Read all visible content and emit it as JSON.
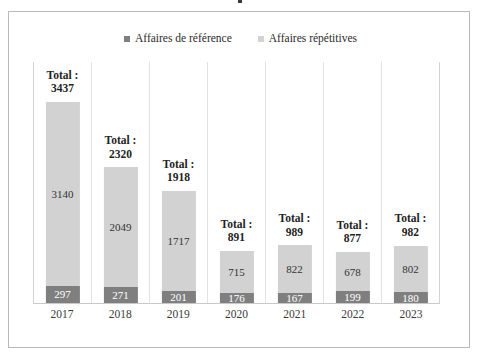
{
  "figure": {
    "background_color": "#ffffff",
    "frame_color": "#b9b9b9"
  },
  "legend": {
    "position": "top-center",
    "entries": [
      {
        "label": "Affaires de référence",
        "color": "#7f7f7f",
        "marker": "square-marker-icon"
      },
      {
        "label": "Affaires répétitives",
        "color": "#d2d2d2",
        "marker": "square-marker-icon"
      }
    ]
  },
  "labels": {
    "total_prefix": "Total :"
  },
  "chart_data": {
    "type": "bar",
    "subtype": "stacked-column",
    "title": "",
    "xlabel": "",
    "ylabel": "",
    "grid": false,
    "ylim": [
      0,
      3437
    ],
    "categories": [
      "2017",
      "2018",
      "2019",
      "2020",
      "2021",
      "2022",
      "2023"
    ],
    "series": [
      {
        "name": "Affaires répétitives",
        "color": "#d2d2d2",
        "values": [
          3140,
          2049,
          1717,
          715,
          822,
          678,
          802
        ]
      },
      {
        "name": "Affaires de référence",
        "color": "#7f7f7f",
        "values": [
          297,
          271,
          201,
          176,
          167,
          199,
          180
        ]
      }
    ],
    "totals": [
      3437,
      2320,
      1918,
      891,
      989,
      877,
      982
    ],
    "total_labels": [
      "Total :\n3437",
      "Total :\n2320",
      "Total :\n1918",
      "Total :\n891",
      "Total :\n989",
      "Total :\n877",
      "Total :\n982"
    ]
  }
}
